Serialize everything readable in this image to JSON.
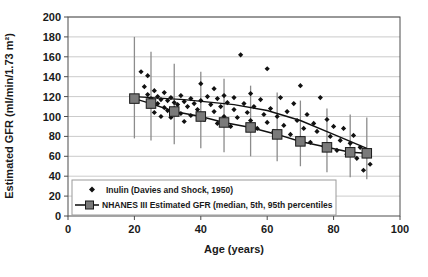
{
  "chart_data": {
    "type": "scatter",
    "title": "",
    "xlabel": "Age (years)",
    "ylabel": "Estimated GFR (ml/min/1.73 m²)",
    "xlim": [
      0,
      100
    ],
    "ylim": [
      0,
      200
    ],
    "xticks": [
      0,
      20,
      40,
      60,
      80,
      100
    ],
    "yticks": [
      0,
      20,
      40,
      60,
      80,
      100,
      120,
      140,
      160,
      180,
      200
    ],
    "grid": "horizontal",
    "legend_position": "lower-left-inside",
    "series": [
      {
        "name": "Inulin (Davies and Shock, 1950)",
        "type": "scatter",
        "marker": "diamond",
        "color": "#111111",
        "points": [
          [
            22,
            145
          ],
          [
            23,
            130
          ],
          [
            24,
            141
          ],
          [
            24,
            122
          ],
          [
            25,
            118
          ],
          [
            25,
            112
          ],
          [
            26,
            126
          ],
          [
            26,
            104
          ],
          [
            27,
            120
          ],
          [
            27,
            113
          ],
          [
            28,
            117
          ],
          [
            28,
            100
          ],
          [
            29,
            124
          ],
          [
            29,
            109
          ],
          [
            30,
            116
          ],
          [
            30,
            106
          ],
          [
            31,
            119
          ],
          [
            31,
            99
          ],
          [
            32,
            114
          ],
          [
            32,
            108
          ],
          [
            33,
            112
          ],
          [
            34,
            121
          ],
          [
            34,
            103
          ],
          [
            35,
            115
          ],
          [
            35,
            95
          ],
          [
            36,
            110
          ],
          [
            37,
            118
          ],
          [
            37,
            101
          ],
          [
            38,
            113
          ],
          [
            39,
            107
          ],
          [
            40,
            133
          ],
          [
            40,
            116
          ],
          [
            41,
            97
          ],
          [
            42,
            120
          ],
          [
            43,
            112
          ],
          [
            44,
            128
          ],
          [
            44,
            105
          ],
          [
            45,
            118
          ],
          [
            45,
            93
          ],
          [
            46,
            110
          ],
          [
            47,
            121
          ],
          [
            47,
            100
          ],
          [
            48,
            114
          ],
          [
            49,
            90
          ],
          [
            50,
            119
          ],
          [
            50,
            107
          ],
          [
            51,
            99
          ],
          [
            52,
            162
          ],
          [
            53,
            113
          ],
          [
            54,
            104
          ],
          [
            55,
            123
          ],
          [
            55,
            96
          ],
          [
            56,
            110
          ],
          [
            57,
            88
          ],
          [
            58,
            117
          ],
          [
            59,
            102
          ],
          [
            60,
            148
          ],
          [
            60,
            94
          ],
          [
            61,
            108
          ],
          [
            62,
            85
          ],
          [
            63,
            100
          ],
          [
            64,
            119
          ],
          [
            65,
            91
          ],
          [
            66,
            105
          ],
          [
            67,
            82
          ],
          [
            68,
            113
          ],
          [
            69,
            96
          ],
          [
            70,
            131
          ],
          [
            70,
            78
          ],
          [
            71,
            88
          ],
          [
            72,
            102
          ],
          [
            73,
            74
          ],
          [
            74,
            93
          ],
          [
            75,
            85
          ],
          [
            76,
            119
          ],
          [
            77,
            70
          ],
          [
            78,
            97
          ],
          [
            79,
            80
          ],
          [
            80,
            90
          ],
          [
            81,
            66
          ],
          [
            82,
            76
          ],
          [
            83,
            88
          ],
          [
            84,
            62
          ],
          [
            85,
            73
          ],
          [
            86,
            81
          ],
          [
            87,
            58
          ],
          [
            88,
            69
          ],
          [
            89,
            46
          ],
          [
            90,
            64
          ],
          [
            91,
            52
          ]
        ]
      },
      {
        "name": "NHANES III Estimated GFR (median, 5th, 95th percentiles",
        "type": "line-with-errorbars",
        "marker": "square",
        "color": "#7a7a7a",
        "line_color": "#111111",
        "median": [
          [
            20,
            118
          ],
          [
            25,
            113
          ],
          [
            32,
            105
          ],
          [
            40,
            100
          ],
          [
            47,
            94
          ],
          [
            55,
            89
          ],
          [
            63,
            82
          ],
          [
            70,
            75
          ],
          [
            78,
            69
          ],
          [
            85,
            64
          ],
          [
            90,
            63
          ]
        ],
        "p95": [
          [
            20,
            180
          ],
          [
            25,
            165
          ],
          [
            32,
            153
          ],
          [
            40,
            145
          ],
          [
            47,
            138
          ],
          [
            55,
            131
          ],
          [
            63,
            124
          ],
          [
            70,
            116
          ],
          [
            78,
            108
          ],
          [
            85,
            102
          ],
          [
            90,
            99
          ]
        ],
        "p5": [
          [
            20,
            78
          ],
          [
            25,
            76
          ],
          [
            32,
            72
          ],
          [
            40,
            68
          ],
          [
            47,
            64
          ],
          [
            55,
            60
          ],
          [
            63,
            55
          ],
          [
            70,
            50
          ],
          [
            78,
            44
          ],
          [
            85,
            39
          ],
          [
            90,
            37
          ]
        ],
        "upper_trend": [
          [
            20,
            120
          ],
          [
            35,
            117
          ],
          [
            50,
            112
          ],
          [
            60,
            106
          ],
          [
            70,
            96
          ],
          [
            80,
            82
          ],
          [
            90,
            68
          ]
        ]
      }
    ]
  },
  "legend": {
    "entries": [
      {
        "label": "Inulin (Davies and Shock, 1950)",
        "marker": "diamond"
      },
      {
        "label": "NHANES III Estimated GFR (median, 5th, 95th percentiles",
        "marker": "line-square"
      }
    ]
  },
  "axes": {
    "x_title": "Age (years)",
    "y_title": "Estimated GFR (ml/min/1.73 m²)",
    "x_tick_labels": [
      "0",
      "20",
      "40",
      "60",
      "80",
      "100"
    ],
    "y_tick_labels": [
      "0",
      "20",
      "40",
      "60",
      "80",
      "100",
      "120",
      "140",
      "160",
      "180",
      "200"
    ]
  },
  "colors": {
    "scatter": "#111111",
    "marker_fill": "#7a7a7a",
    "marker_stroke": "#1a1a1a",
    "errorbar": "#8c8c8c",
    "gridline": "#b5b5b5",
    "axis": "#4d4d4d",
    "background": "#ffffff"
  }
}
